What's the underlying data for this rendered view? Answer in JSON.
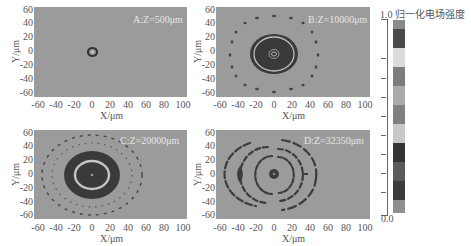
{
  "chart_data": [
    {
      "type": "heatmap",
      "title": "A:Z=500μm",
      "xlabel": "X/μm",
      "ylabel": "Y/μm",
      "xlim": [
        -65,
        105
      ],
      "ylim": [
        -65,
        65
      ],
      "xticks": [
        -60,
        -40,
        -20,
        0,
        20,
        40,
        60,
        80,
        100
      ],
      "yticks": [
        60,
        40,
        20,
        0,
        -20,
        -40,
        -60
      ],
      "description": "Uniform background (~0.5) with a single small dark ring centered at (0,0), radius ~3 μm, bright center dot"
    },
    {
      "type": "heatmap",
      "title": "B:Z=10000μm",
      "xlabel": "X/μm",
      "ylabel": "Y/μm",
      "xlim": [
        -65,
        105
      ],
      "ylim": [
        -65,
        65
      ],
      "xticks": [
        -60,
        -40,
        -20,
        0,
        20,
        40,
        60,
        80,
        100
      ],
      "yticks": [
        60,
        40,
        20,
        0,
        -20,
        -40,
        -60
      ],
      "description": "Dark filled disk radius ~25 μm with light inner ring at ~20 μm and small concentric rings at center; outer ring of ~18 dark dots at radius ~50 μm"
    },
    {
      "type": "heatmap",
      "title": "C:Z=20000μm",
      "xlabel": "X/μm",
      "ylabel": "Y/μm",
      "xlim": [
        -65,
        105
      ],
      "ylim": [
        -65,
        65
      ],
      "xticks": [
        -60,
        -40,
        -20,
        0,
        20,
        40,
        60,
        80,
        100
      ],
      "yticks": [
        60,
        40,
        20,
        0,
        -20,
        -40,
        -60
      ],
      "description": "Dark elliptical annulus (rx~32, ry~30 μm) with bright ring at ~18 μm, dark core; two dashed rings of dots at ~42 μm and ~52 μm"
    },
    {
      "type": "heatmap",
      "title": "D:Z=32350μm",
      "xlabel": "X/μm",
      "ylabel": "Y/μm",
      "xlim": [
        -65,
        105
      ],
      "ylim": [
        -65,
        65
      ],
      "xticks": [
        -60,
        -40,
        -20,
        0,
        20,
        40,
        60,
        80,
        100
      ],
      "yticks": [
        60,
        40,
        20,
        0,
        -20,
        -40,
        -60
      ],
      "description": "Asymmetric broken concentric dark arcs centered near (0,0): outer ellipse rx~48 ry~48 μm, inner rings ~10–30 μm, dark lens feature at x≈-28, short dash at x≈+40"
    }
  ],
  "colorbar": {
    "title": "归一化电场强度",
    "max_label": "1.0",
    "min_label": "0.0",
    "bands": [
      "#8a8a8a",
      "#4a4a4a",
      "#dcdcdc",
      "#7d7d7d",
      "#aaaaaa",
      "#808080",
      "#c8c8c8",
      "#333333",
      "#5a5a5a",
      "#3c3c3c",
      "#8f8f8f"
    ]
  },
  "panels": [
    {
      "label": "A:Z=500μm"
    },
    {
      "label": "B:Z=10000μm"
    },
    {
      "label": "C:Z=20000μm"
    },
    {
      "label": "D:Z=32350μm"
    }
  ],
  "axis": {
    "xlabel": "X/μm",
    "ylabel": "Y/μm",
    "xticks": [
      "-60",
      "-40",
      "-20",
      "0",
      "20",
      "40",
      "60",
      "80",
      "100"
    ],
    "yticks": [
      "60",
      "40",
      "20",
      "0",
      "-20",
      "-40",
      "-60"
    ]
  }
}
